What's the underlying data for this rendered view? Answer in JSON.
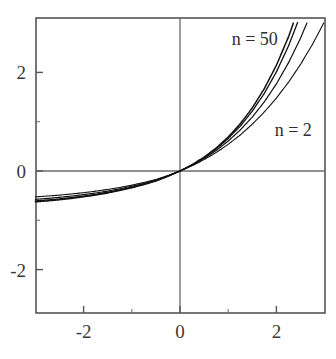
{
  "chart_data": {
    "type": "line",
    "title": "",
    "subtitle": "",
    "xlabel": "",
    "ylabel": "",
    "xlim": [
      -3,
      3
    ],
    "ylim": [
      -3,
      3
    ],
    "grid": false,
    "legend_position": "inline-annotations",
    "x_ticks_major": [
      -2,
      0,
      2
    ],
    "x_tick_labels": [
      "-2",
      "0",
      "2"
    ],
    "x_ticks_minor": [
      -1,
      1
    ],
    "y_ticks_major": [
      2,
      0,
      -2
    ],
    "y_tick_labels": [
      "2",
      "0",
      "-2"
    ],
    "y_ticks_minor": [
      1,
      -1
    ],
    "annotations": [
      {
        "text": "n = 50",
        "x": 1.55,
        "y": 2.55
      },
      {
        "text": "n = 2",
        "x": 2.35,
        "y": 0.72
      }
    ],
    "series": [
      {
        "name": "n = 2",
        "n": 2,
        "x": [
          -3.0,
          -2.75,
          -2.5,
          -2.25,
          -2.0,
          -1.75,
          -1.5,
          -1.25,
          -1.0,
          -0.75,
          -0.5,
          -0.25,
          0.0,
          0.25,
          0.5,
          0.75,
          1.0,
          1.25,
          1.5,
          1.75,
          2.0,
          2.25,
          2.5,
          2.75,
          3.0
        ],
        "values": [
          -0.525,
          -0.508,
          -0.489,
          -0.466,
          -0.44,
          -0.409,
          -0.374,
          -0.333,
          -0.287,
          -0.233,
          -0.172,
          -0.092,
          0.0,
          0.106,
          0.231,
          0.375,
          0.541,
          0.731,
          0.949,
          1.197,
          1.479,
          1.799,
          2.162,
          2.572,
          3.035
        ]
      },
      {
        "name": "n = 5",
        "n": 5,
        "x": [
          -3.0,
          -2.75,
          -2.5,
          -2.25,
          -2.0,
          -1.75,
          -1.5,
          -1.25,
          -1.0,
          -0.75,
          -0.5,
          -0.25,
          0.0,
          0.25,
          0.5,
          0.75,
          1.0,
          1.25,
          1.5,
          1.75,
          2.0,
          2.25,
          2.5,
          2.75,
          3.0
        ],
        "values": [
          -0.575,
          -0.556,
          -0.534,
          -0.509,
          -0.479,
          -0.446,
          -0.407,
          -0.362,
          -0.311,
          -0.252,
          -0.185,
          -0.099,
          0.0,
          0.116,
          0.254,
          0.416,
          0.607,
          0.831,
          1.095,
          1.404,
          1.767,
          2.193,
          2.692,
          3.276,
          3.959
        ]
      },
      {
        "name": "n = 15",
        "n": 15,
        "x": [
          -3.0,
          -2.75,
          -2.5,
          -2.25,
          -2.0,
          -1.75,
          -1.5,
          -1.25,
          -1.0,
          -0.75,
          -0.5,
          -0.25,
          0.0,
          0.25,
          0.5,
          0.75,
          1.0,
          1.25,
          1.5,
          1.75,
          2.0,
          2.25,
          2.5,
          2.75,
          3.0
        ],
        "values": [
          -0.607,
          -0.588,
          -0.566,
          -0.539,
          -0.508,
          -0.472,
          -0.431,
          -0.383,
          -0.329,
          -0.267,
          -0.196,
          -0.104,
          0.0,
          0.123,
          0.271,
          0.448,
          0.659,
          0.911,
          1.214,
          1.576,
          2.011,
          2.534,
          3.162,
          3.917,
          4.825
        ]
      },
      {
        "name": "n = 50",
        "n": 50,
        "x": [
          -3.0,
          -2.75,
          -2.5,
          -2.25,
          -2.0,
          -1.75,
          -1.5,
          -1.25,
          -1.0,
          -0.75,
          -0.5,
          -0.25,
          0.0,
          0.25,
          0.5,
          0.75,
          1.0,
          1.25,
          1.5,
          1.75,
          2.0,
          2.25,
          2.5,
          2.75,
          3.0
        ],
        "values": [
          -0.625,
          -0.606,
          -0.583,
          -0.556,
          -0.524,
          -0.487,
          -0.444,
          -0.395,
          -0.339,
          -0.275,
          -0.202,
          -0.107,
          0.0,
          0.127,
          0.281,
          0.466,
          0.689,
          0.957,
          1.281,
          1.672,
          2.145,
          2.718,
          3.412,
          4.253,
          5.273
        ]
      }
    ]
  },
  "figure": {
    "background_color": "#ffffff",
    "axis_color": "#555555",
    "curve_color": "#111111",
    "text_color": "#3a3a3a"
  }
}
